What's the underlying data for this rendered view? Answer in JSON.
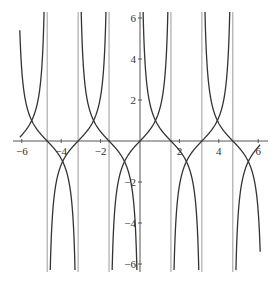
{
  "chart_data": {
    "type": "line",
    "title": "",
    "xlabel": "",
    "ylabel": "",
    "xlim": [
      -6.1,
      6.1
    ],
    "ylim": [
      -6.3,
      6.3
    ],
    "grid": false,
    "legend": null,
    "x_ticks": [
      -6,
      -4,
      -2,
      2,
      4,
      6
    ],
    "x_tick_labels": [
      "−6",
      "−4",
      "−2",
      "2",
      "4",
      "6"
    ],
    "y_ticks": [
      6,
      4,
      2,
      -2,
      -4,
      -6
    ],
    "y_tick_labels": [
      "6",
      "4",
      "2",
      "−2",
      "−4",
      "−6"
    ],
    "series": [
      {
        "name": "tan(x)",
        "function": "tan",
        "color": "#333333"
      },
      {
        "name": "cot(x)",
        "function": "cot",
        "color": "#333333"
      }
    ],
    "asymptote_lines": {
      "x": [
        -4.712,
        -3.1416,
        -1.5708,
        1.5708,
        3.1416,
        4.712
      ],
      "color": "#9a9a9a"
    },
    "intersections": [
      {
        "x": -5.498,
        "y": 1
      },
      {
        "x": -3.927,
        "y": -1
      },
      {
        "x": -2.356,
        "y": 1
      },
      {
        "x": -0.785,
        "y": -1
      },
      {
        "x": 0.785,
        "y": 1
      },
      {
        "x": 2.356,
        "y": -1
      },
      {
        "x": 3.927,
        "y": 1
      },
      {
        "x": 5.498,
        "y": -1
      }
    ]
  },
  "layout": {
    "origin_px": [
      140,
      141
    ],
    "x_scale_px": 19.7,
    "y_scale_px": 20.5,
    "x_axis_extent_px": [
      13,
      268
    ],
    "y_axis_extent_px": [
      12,
      272
    ],
    "axis_color": "#555555"
  }
}
